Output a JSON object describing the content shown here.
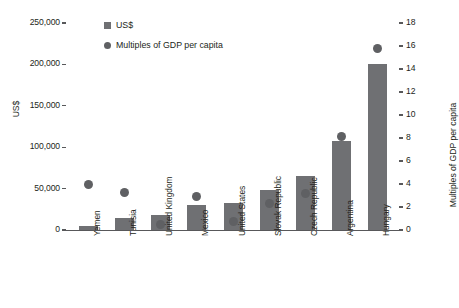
{
  "chart_data": {
    "type": "bar",
    "title": "",
    "subtitle": "",
    "categories": [
      "Yemen",
      "Tunisia",
      "United Kingdom",
      "Mexico",
      "United States",
      "Slovak Republic",
      "Czech Republic",
      "Argentina",
      "Hungary"
    ],
    "series": [
      {
        "name": "US$",
        "axis": "left",
        "mark": "bar",
        "values": [
          5000,
          14000,
          18000,
          30000,
          33000,
          48000,
          65000,
          108000,
          200000
        ]
      },
      {
        "name": "Multiples of GDP per capita",
        "axis": "right",
        "mark": "dot",
        "values": [
          4.0,
          3.3,
          0.5,
          2.9,
          0.75,
          2.3,
          3.2,
          8.1,
          15.8
        ]
      }
    ],
    "ylabel": "US$",
    "ylabel_right": "Multiples of GDP per capita",
    "xlabel": "",
    "ylim": [
      0,
      250000
    ],
    "ylim_right": [
      0,
      18
    ],
    "yticks": [
      0,
      50000,
      100000,
      150000,
      200000,
      250000
    ],
    "ytick_labels": [
      "0",
      "50,000",
      "100,000",
      "150,000",
      "200,000",
      "250,000"
    ],
    "yticks_right": [
      0,
      2,
      4,
      6,
      8,
      10,
      12,
      14,
      16,
      18
    ],
    "ytick_labels_right": [
      "0",
      "2",
      "4",
      "6",
      "8",
      "10",
      "12",
      "14",
      "16",
      "18"
    ],
    "grid": false,
    "legend_position": "top-left",
    "colors": {
      "bar": "#6f7073",
      "dot": "#5f6063",
      "axis": "#58585a",
      "text": "#231f20",
      "background": "#ffffff"
    }
  },
  "legend": {
    "items": [
      {
        "label": "US$",
        "marker": "square"
      },
      {
        "label": "Multiples of GDP per capita",
        "marker": "circle"
      }
    ]
  }
}
